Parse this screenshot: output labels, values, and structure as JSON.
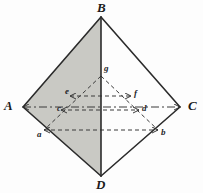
{
  "figure": {
    "background_color": "#fdfdfd",
    "shade_color": "#c9c9c4",
    "outline_color": "#2b2b2b",
    "dash_color": "#3a3a3a"
  },
  "vertices": [
    {
      "id": "B",
      "label": "B",
      "x": 101,
      "y": 17,
      "label_x": 97,
      "label_y": 1
    },
    {
      "id": "A",
      "label": "A",
      "x": 23,
      "y": 107,
      "label_x": 4,
      "label_y": 99
    },
    {
      "id": "C",
      "label": "C",
      "x": 180,
      "y": 107,
      "label_x": 188,
      "label_y": 99
    },
    {
      "id": "D",
      "label": "D",
      "x": 101,
      "y": 176,
      "label_x": 96,
      "label_y": 178
    }
  ],
  "points": [
    {
      "id": "g",
      "label": "g",
      "x": 101,
      "y": 76,
      "label_x": 104,
      "label_y": 64
    },
    {
      "id": "e",
      "label": "e",
      "x": 70,
      "y": 96,
      "label_x": 65,
      "label_y": 87
    },
    {
      "id": "f",
      "label": "f",
      "x": 131,
      "y": 96,
      "label_x": 134,
      "label_y": 89
    },
    {
      "id": "c",
      "label": "c",
      "x": 61,
      "y": 110,
      "label_x": 57,
      "label_y": 104
    },
    {
      "id": "d",
      "label": "d",
      "x": 139,
      "y": 110,
      "label_x": 142,
      "label_y": 104
    },
    {
      "id": "a",
      "label": "a",
      "x": 44,
      "y": 130,
      "label_x": 37,
      "label_y": 130
    },
    {
      "id": "b",
      "label": "b",
      "x": 158,
      "y": 130,
      "label_x": 161,
      "label_y": 128
    }
  ],
  "shaded_region": {
    "name": "triangle-ABD",
    "points": "23,107 101,17 101,176"
  },
  "solid_edges": [
    {
      "name": "edge-AB",
      "x1": 23,
      "y1": 107,
      "x2": 101,
      "y2": 17
    },
    {
      "name": "edge-BC",
      "x1": 101,
      "y1": 17,
      "x2": 180,
      "y2": 107
    },
    {
      "name": "edge-CD",
      "x1": 180,
      "y1": 107,
      "x2": 101,
      "y2": 176
    },
    {
      "name": "edge-DA",
      "x1": 101,
      "y1": 176,
      "x2": 23,
      "y2": 107
    },
    {
      "name": "edge-BD",
      "x1": 101,
      "y1": 17,
      "x2": 101,
      "y2": 176
    }
  ],
  "dashdot_lines": [
    {
      "name": "axis-AC",
      "x1": 23,
      "y1": 107,
      "x2": 180,
      "y2": 107
    }
  ],
  "dashed_lines": [
    {
      "name": "line-ga",
      "x1": 101,
      "y1": 76,
      "x2": 44,
      "y2": 130
    },
    {
      "name": "line-gb",
      "x1": 101,
      "y1": 76,
      "x2": 158,
      "y2": 130
    },
    {
      "name": "line-ef",
      "x1": 70,
      "y1": 96,
      "x2": 131,
      "y2": 96
    },
    {
      "name": "line-cd",
      "x1": 61,
      "y1": 110,
      "x2": 139,
      "y2": 110
    },
    {
      "name": "line-ab",
      "x1": 44,
      "y1": 130,
      "x2": 158,
      "y2": 130
    }
  ]
}
